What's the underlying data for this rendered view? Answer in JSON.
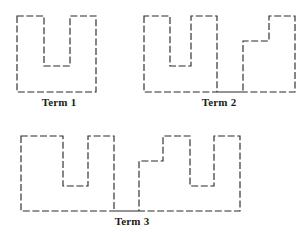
{
  "figure": {
    "title": "",
    "background_color": "#ffffff",
    "stroke_color": "#2b2b2b",
    "line_style": "dashed",
    "terms": [
      {
        "id": "term-1",
        "label": "Term 1",
        "shape": "U",
        "units": 1,
        "label_x": 26,
        "label_y": 96,
        "path": "M 17 16 L 17 92 L 96 92 L 96 16 L 70 16 L 70 66 L 44 66 L 44 16 Z"
      },
      {
        "id": "term-2",
        "label": "Term 2",
        "shape": "U + inverted-U",
        "units": 2,
        "label_x": 186,
        "label_y": 96,
        "path": "M 144 16 L 144 92 L 295 92 L 295 16 L 269 16 L 269 41 L 243 41 L 243 92 L 217 92 L 217 16 L 191 16 L 191 66 L 170 66 L 170 16 Z"
      },
      {
        "id": "term-3",
        "label": "Term 3",
        "shape": "U + inverted-U + U",
        "units": 3,
        "label_x": 97,
        "label_y": 215,
        "path": "M 21 136 L 21 211 L 240 211 L 240 136 L 214 136 L 214 186 L 190 186 L 190 136 L 163 136 L 163 161 L 139 161 L 139 211 L 114 211 L 114 136 L 88 136 L 88 186 L 63 186 L 63 136 Z"
      }
    ]
  }
}
